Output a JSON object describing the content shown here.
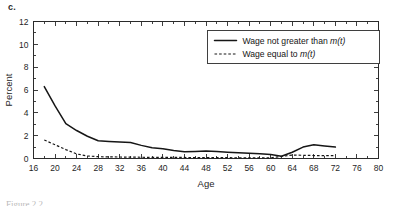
{
  "figure": {
    "panel_label": "c.",
    "caption": "Figure 2.2"
  },
  "chart_data": {
    "type": "line",
    "title": "",
    "xlabel": "Age",
    "ylabel": "Percent",
    "xlim": [
      16,
      80
    ],
    "ylim": [
      0,
      12
    ],
    "xticks": [
      16,
      20,
      24,
      28,
      32,
      36,
      40,
      44,
      48,
      52,
      56,
      60,
      64,
      68,
      72,
      76,
      80
    ],
    "yticks": [
      0,
      2,
      4,
      6,
      8,
      10,
      12
    ],
    "xtick_labels": [
      "16",
      "20",
      "24",
      "28",
      "32",
      "36",
      "40",
      "44",
      "48",
      "52",
      "56",
      "60",
      "64",
      "68",
      "72",
      "76",
      "80"
    ],
    "ytick_labels": [
      "0",
      "2",
      "4",
      "6",
      "8",
      "10",
      "12"
    ],
    "grid": false,
    "legend_position": "top-right",
    "minor_xticks_step": 2,
    "minor_yticks_step": 1,
    "series": [
      {
        "name": "Wage not greater than m(t)",
        "style": "solid",
        "color": "#161616",
        "x": [
          18,
          20,
          22,
          24,
          26,
          28,
          30,
          32,
          34,
          36,
          38,
          40,
          42,
          44,
          46,
          48,
          50,
          52,
          54,
          56,
          58,
          60,
          62,
          64,
          66,
          68,
          70,
          72
        ],
        "values": [
          6.3,
          4.6,
          3.05,
          2.45,
          1.95,
          1.55,
          1.5,
          1.45,
          1.4,
          1.15,
          0.95,
          0.85,
          0.7,
          0.6,
          0.62,
          0.65,
          0.62,
          0.55,
          0.5,
          0.45,
          0.42,
          0.35,
          0.2,
          0.55,
          1.0,
          1.2,
          1.1,
          1.0
        ]
      },
      {
        "name": "Wage equal to m(t)",
        "style": "dashed",
        "color": "#161616",
        "x": [
          18,
          20,
          22,
          24,
          26,
          28,
          30,
          32,
          34,
          36,
          38,
          40,
          42,
          44,
          46,
          48,
          50,
          52,
          54,
          56,
          58,
          60,
          62,
          64,
          66,
          68,
          70,
          72
        ],
        "values": [
          1.62,
          1.2,
          0.78,
          0.4,
          0.22,
          0.16,
          0.14,
          0.13,
          0.12,
          0.11,
          0.1,
          0.1,
          0.09,
          0.09,
          0.08,
          0.08,
          0.08,
          0.07,
          0.06,
          0.05,
          0.05,
          0.06,
          0.18,
          0.3,
          0.28,
          0.26,
          0.25,
          0.25
        ]
      }
    ],
    "legend": [
      {
        "label_prefix": "Wage not greater than ",
        "label_var": "m(t)",
        "style": "solid"
      },
      {
        "label_prefix": "Wage equal to ",
        "label_var": "m(t)",
        "style": "dashed"
      }
    ]
  }
}
